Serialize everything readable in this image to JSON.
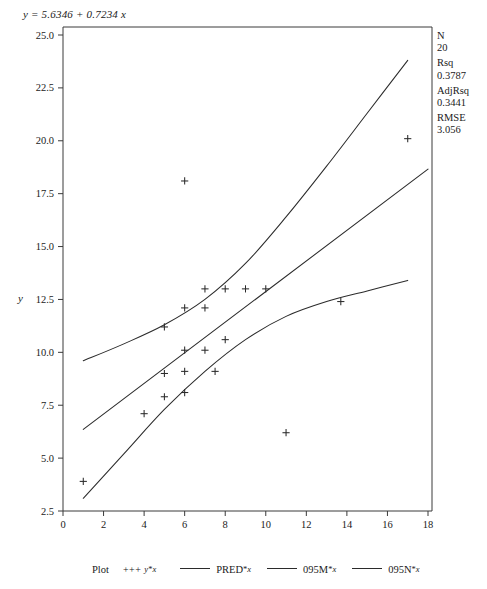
{
  "equation": "y = 5.6346 + 0.7234 x",
  "stats": [
    {
      "label": "N",
      "value": "20"
    },
    {
      "label": "Rsq",
      "value": "0.3787"
    },
    {
      "label": "AdjRsq",
      "value": "0.3441"
    },
    {
      "label": "RMSE",
      "value": "3.056"
    }
  ],
  "axis": {
    "ylabel": "y",
    "xlabel": "",
    "xticks": [
      "0",
      "2",
      "4",
      "6",
      "8",
      "10",
      "12",
      "14",
      "16",
      "18"
    ],
    "yticks": [
      "2.5",
      "5.0",
      "7.5",
      "10.0",
      "12.5",
      "15.0",
      "17.5",
      "20.0",
      "22.5",
      "25.0"
    ]
  },
  "legend": {
    "title": "Plot",
    "items": [
      {
        "marker": "+++",
        "label": "y",
        "sep": "*",
        "label2": "x",
        "type": "symbol"
      },
      {
        "marker": "line",
        "label": "PRED",
        "sep": "*",
        "label2": "x",
        "type": "line"
      },
      {
        "marker": "line",
        "label": "095M",
        "sep": "*",
        "label2": "x",
        "type": "line"
      },
      {
        "marker": "line",
        "label": "095N",
        "sep": "*",
        "label2": "x",
        "type": "line"
      }
    ]
  },
  "chart_data": {
    "type": "scatter",
    "title": "",
    "xlabel": "",
    "ylabel": "y",
    "xlim": [
      0,
      18
    ],
    "ylim": [
      2.5,
      25.0
    ],
    "grid": false,
    "legend_position": "bottom",
    "regression": {
      "intercept": 5.6346,
      "slope": 0.7234,
      "n": 20,
      "rsq": 0.3787,
      "adj_rsq": 0.3441,
      "rmse": 3.056
    },
    "series": [
      {
        "name": "y*x",
        "type": "scatter",
        "marker": "plus",
        "points": [
          {
            "x": 1.0,
            "y": 3.9
          },
          {
            "x": 4.0,
            "y": 7.1
          },
          {
            "x": 5.0,
            "y": 7.9
          },
          {
            "x": 5.0,
            "y": 9.0
          },
          {
            "x": 6.0,
            "y": 8.1
          },
          {
            "x": 6.0,
            "y": 9.1
          },
          {
            "x": 6.0,
            "y": 10.1
          },
          {
            "x": 6.0,
            "y": 12.1
          },
          {
            "x": 6.0,
            "y": 18.1
          },
          {
            "x": 5.0,
            "y": 11.2
          },
          {
            "x": 7.0,
            "y": 10.1
          },
          {
            "x": 7.0,
            "y": 12.1
          },
          {
            "x": 7.0,
            "y": 13.0
          },
          {
            "x": 7.5,
            "y": 9.1
          },
          {
            "x": 8.0,
            "y": 10.6
          },
          {
            "x": 8.0,
            "y": 13.0
          },
          {
            "x": 9.0,
            "y": 13.0
          },
          {
            "x": 10.0,
            "y": 13.0
          },
          {
            "x": 11.0,
            "y": 6.2
          },
          {
            "x": 13.7,
            "y": 12.4
          },
          {
            "x": 17.0,
            "y": 20.1
          }
        ]
      },
      {
        "name": "PRED*x",
        "type": "line",
        "comment": "fitted regression line",
        "points": [
          {
            "x": 1.0,
            "y": 6.36
          },
          {
            "x": 18.0,
            "y": 18.66
          }
        ]
      },
      {
        "name": "095M*x",
        "type": "line",
        "comment": "upper 95% band",
        "points": [
          {
            "x": 1.0,
            "y": 9.6
          },
          {
            "x": 3.0,
            "y": 10.4
          },
          {
            "x": 5.0,
            "y": 11.3
          },
          {
            "x": 7.0,
            "y": 12.5
          },
          {
            "x": 9.0,
            "y": 14.2
          },
          {
            "x": 11.0,
            "y": 16.4
          },
          {
            "x": 13.0,
            "y": 18.8
          },
          {
            "x": 15.0,
            "y": 21.3
          },
          {
            "x": 17.0,
            "y": 23.8
          }
        ]
      },
      {
        "name": "095N*x",
        "type": "line",
        "comment": "lower 95% band",
        "points": [
          {
            "x": 1.0,
            "y": 3.1
          },
          {
            "x": 3.0,
            "y": 5.2
          },
          {
            "x": 5.0,
            "y": 7.3
          },
          {
            "x": 7.0,
            "y": 9.1
          },
          {
            "x": 9.0,
            "y": 10.6
          },
          {
            "x": 11.0,
            "y": 11.7
          },
          {
            "x": 13.0,
            "y": 12.4
          },
          {
            "x": 15.0,
            "y": 12.9
          },
          {
            "x": 17.0,
            "y": 13.4
          }
        ]
      }
    ]
  }
}
